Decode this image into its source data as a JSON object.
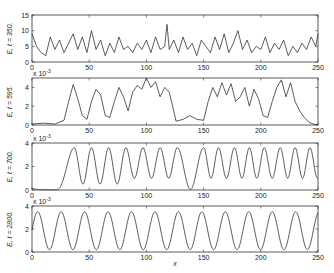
{
  "chart_data": [
    {
      "type": "line",
      "title": "",
      "ylabel": "E, t = 350.",
      "xlabel": "",
      "xlim": [
        0,
        250
      ],
      "ylim": [
        0,
        15
      ],
      "yticks": [
        0,
        5,
        10,
        15
      ],
      "xticks": [
        0,
        50,
        100,
        150,
        200,
        250
      ],
      "y_exponent": "",
      "grid": false,
      "description": "Noisy irregular signal fluctuating 1-10 with spike ~12 near x=118",
      "series": [
        {
          "name": "E",
          "x": [
            0,
            4,
            8,
            12,
            16,
            20,
            24,
            28,
            32,
            36,
            40,
            44,
            48,
            52,
            56,
            60,
            64,
            68,
            72,
            76,
            80,
            84,
            88,
            92,
            96,
            100,
            104,
            108,
            112,
            116,
            118,
            120,
            124,
            128,
            132,
            136,
            140,
            144,
            148,
            152,
            156,
            160,
            164,
            168,
            172,
            176,
            180,
            184,
            188,
            192,
            196,
            200,
            204,
            208,
            212,
            216,
            220,
            224,
            228,
            232,
            236,
            240,
            244,
            248,
            250
          ],
          "y": [
            9,
            5,
            3,
            2,
            8,
            4,
            7,
            3,
            6,
            9,
            4,
            8,
            3,
            10,
            4,
            7,
            2,
            6,
            3,
            8,
            4,
            5,
            3,
            6,
            4,
            7,
            3,
            8,
            4,
            5,
            12,
            4,
            7,
            3,
            8,
            4,
            6,
            2,
            7,
            5,
            3,
            8,
            4,
            9,
            3,
            6,
            10,
            4,
            7,
            3,
            5,
            4,
            8,
            3,
            6,
            4,
            7,
            2,
            5,
            3,
            6,
            4,
            8,
            5,
            9
          ]
        }
      ]
    },
    {
      "type": "line",
      "title": "",
      "ylabel": "E, t = 595.",
      "xlabel": "",
      "xlim": [
        0,
        250
      ],
      "ylim": [
        0,
        5
      ],
      "yticks": [
        0,
        2,
        4
      ],
      "xticks": [
        0,
        50,
        100,
        150,
        200,
        250
      ],
      "y_exponent": "x 10^-3",
      "grid": false,
      "description": "Flat near zero until x~28, irregular bumps to ~5 near x~98, low plateau x~110-150, bumps again to ~4.5, decays at 250",
      "series": [
        {
          "name": "E",
          "x": [
            0,
            10,
            20,
            28,
            32,
            36,
            40,
            44,
            48,
            52,
            56,
            60,
            64,
            68,
            72,
            76,
            80,
            84,
            88,
            92,
            96,
            100,
            104,
            108,
            112,
            116,
            120,
            126,
            132,
            138,
            144,
            150,
            154,
            158,
            162,
            166,
            170,
            174,
            178,
            182,
            186,
            190,
            194,
            198,
            202,
            206,
            210,
            214,
            218,
            222,
            226,
            230,
            234,
            238,
            242,
            246,
            250
          ],
          "y": [
            0.1,
            0.2,
            0.1,
            0.5,
            2.5,
            4.3,
            2.8,
            1.0,
            0.6,
            2.5,
            3.8,
            3.2,
            1.0,
            0.8,
            2.5,
            4.0,
            3.0,
            1.5,
            3.5,
            4.2,
            3.8,
            5.0,
            4.0,
            4.6,
            3.0,
            4.0,
            3.5,
            0.4,
            0.6,
            1.0,
            0.6,
            0.5,
            2.5,
            4.0,
            3.0,
            4.5,
            3.2,
            4.4,
            2.5,
            3.0,
            4.0,
            2.0,
            3.8,
            2.8,
            1.0,
            0.8,
            2.5,
            4.0,
            4.8,
            3.0,
            4.5,
            2.5,
            1.5,
            0.8,
            0.3,
            0.1,
            0.0
          ]
        }
      ]
    },
    {
      "type": "line",
      "title": "",
      "ylabel": "E, t = 700.",
      "xlabel": "",
      "xlim": [
        0,
        250
      ],
      "ylim": [
        0,
        4
      ],
      "yticks": [
        0,
        2,
        4
      ],
      "xticks": [
        0,
        50,
        100,
        150,
        200,
        250
      ],
      "y_exponent": "x 10^-3",
      "grid": false,
      "description": "Near zero until x~20, then quasi-sinusoidal peaks ~3.5 with variable spacing",
      "peaks_x": [
        37,
        52,
        67,
        82,
        97,
        112,
        127,
        150,
        163,
        177,
        190,
        203,
        217,
        230,
        243
      ],
      "peak_value": 3.6,
      "trough_values_range": [
        0.3,
        1.2
      ]
    },
    {
      "type": "line",
      "title": "",
      "ylabel": "E, t = 2800.",
      "xlabel": "x",
      "xlim": [
        0,
        250
      ],
      "ylim": [
        0,
        4
      ],
      "yticks": [
        0,
        2,
        4
      ],
      "xticks": [
        0,
        50,
        100,
        150,
        200,
        250
      ],
      "y_exponent": "x 10^-3",
      "grid": false,
      "description": "Regular sinusoid, period ~20.5, peak ~3.5, trough ~0.2",
      "period": 20.5,
      "peak_value": 3.5,
      "trough_value": 0.2,
      "first_peak_x": 5
    }
  ],
  "labels": {
    "xlabel": "x",
    "exponent": "x 10",
    "exponent_power": "-3"
  }
}
